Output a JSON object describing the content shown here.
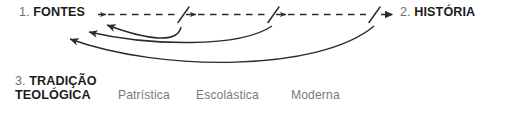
{
  "diagram": {
    "background_color": "#ffffff",
    "stroke_color": "#2b2b2b",
    "label_color": "#1c1c1c",
    "number_color": "#6f6f6f",
    "period_color": "#7a7a7a",
    "nodes": [
      {
        "id": "fontes",
        "number": "1.",
        "name": "FONTES",
        "x": 19,
        "y": 5
      },
      {
        "id": "historia",
        "number": "2.",
        "name": "HISTÓRIA",
        "x": 400,
        "y": 5
      },
      {
        "id": "tradicao",
        "number": "3.",
        "name": "TRADIÇÃO",
        "name_line2": "TEOLÓGICA",
        "x": 15,
        "y": 74
      }
    ],
    "periods": [
      {
        "id": "patristica",
        "label": "Patrística",
        "x": 118
      },
      {
        "id": "escolastica",
        "label": "Escolástica",
        "x": 196
      },
      {
        "id": "moderna",
        "label": "Moderna",
        "x": 291
      }
    ],
    "flow": {
      "forward_arrow_label": "dashed-arrow-fontes-to-historia",
      "forward_style": "dashed",
      "forward_segments": 3,
      "slash_marks": 3,
      "return_arrows": 3,
      "return_style": "solid-curved",
      "direction_forward": "left-to-right",
      "direction_return": "right-to-left"
    }
  }
}
